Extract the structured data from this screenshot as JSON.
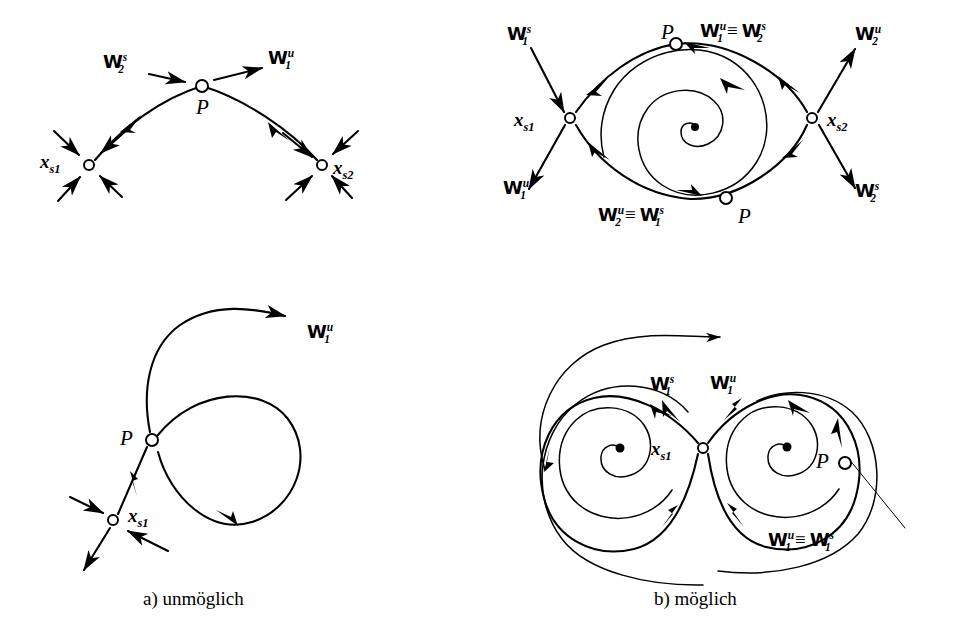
{
  "figure": {
    "kind": "mathematical-phase-portrait-diagram",
    "background_color": "#ffffff",
    "ink_color": "#000000",
    "captions": [
      {
        "id": "caption-a",
        "text": "a) unmöglich",
        "x": 143,
        "y": 597
      },
      {
        "id": "caption-b",
        "text": "b) möglich",
        "x": 654,
        "y": 597
      }
    ]
  },
  "panels": [
    {
      "id": "panel-top-left",
      "position": "top-left",
      "description": "Heteroclinic arc from saddle x_s1 over point P to saddle x_s2",
      "labels": [
        {
          "name": "label-W2s",
          "base": "W",
          "sup": "s",
          "sub": "2",
          "x": 103,
          "y": 58
        },
        {
          "name": "label-W1u",
          "base": "W",
          "sup": "u",
          "sub": "1",
          "x": 268,
          "y": 54
        },
        {
          "name": "label-P",
          "text": "P",
          "x": 196,
          "y": 99
        },
        {
          "name": "label-xs1",
          "base": "x",
          "sub": "s1",
          "x": 44,
          "y": 148
        },
        {
          "name": "label-xs2",
          "base": "x",
          "sub": "s2",
          "x": 333,
          "y": 155
        }
      ],
      "nodes": [
        {
          "name": "saddle-xs1",
          "type": "open-circle",
          "x": 89,
          "y": 165
        },
        {
          "name": "point-P",
          "type": "open-circle",
          "x": 202,
          "y": 86
        },
        {
          "name": "saddle-xs2",
          "type": "open-circle",
          "x": 322,
          "y": 165
        }
      ]
    },
    {
      "id": "panel-top-right",
      "position": "top-right",
      "description": "Lens shaped heteroclinic cycle between saddles x_s1 and x_s2 enclosing an unstable spiral focus",
      "labels": [
        {
          "name": "label-W1s",
          "base": "W",
          "sup": "s",
          "sub": "1",
          "x": 507,
          "y": 29
        },
        {
          "name": "label-P-top",
          "text": "P",
          "x": 665,
          "y": 27
        },
        {
          "name": "label-W1u-eq-W2s",
          "base": "W",
          "sup": "u",
          "sub": "1",
          "eq": "≡",
          "base2": "W",
          "sup2": "s",
          "sub2": "2",
          "x": 700,
          "y": 26
        },
        {
          "name": "label-W2u",
          "base": "W",
          "sup": "u",
          "sub": "2",
          "x": 855,
          "y": 29
        },
        {
          "name": "label-xs1",
          "base": "x",
          "sub": "s1",
          "x": 518,
          "y": 108
        },
        {
          "name": "label-xs2",
          "base": "x",
          "sub": "s2",
          "x": 827,
          "y": 108
        },
        {
          "name": "label-W1u",
          "base": "W",
          "sup": "u",
          "sub": "1",
          "x": 505,
          "y": 182
        },
        {
          "name": "label-W2s",
          "base": "W",
          "sup": "s",
          "sub": "2",
          "x": 855,
          "y": 185
        },
        {
          "name": "label-W2u-eq-W1s",
          "base": "W",
          "sup": "u",
          "sub": "2",
          "eq": "≡",
          "base2": "W",
          "sup2": "s",
          "sub2": "1",
          "x": 600,
          "y": 209
        },
        {
          "name": "label-P-bottom",
          "text": "P",
          "x": 741,
          "y": 208
        }
      ],
      "nodes": [
        {
          "name": "saddle-xs1",
          "type": "open-circle",
          "x": 570,
          "y": 118
        },
        {
          "name": "saddle-xs2",
          "type": "open-circle",
          "x": 812,
          "y": 118
        },
        {
          "name": "point-P-top",
          "type": "open-circle",
          "x": 676,
          "y": 44
        },
        {
          "name": "point-P-bottom",
          "type": "open-circle",
          "x": 726,
          "y": 198
        },
        {
          "name": "spiral-focus",
          "type": "filled-dot",
          "x": 695,
          "y": 127
        }
      ]
    },
    {
      "id": "panel-bottom-left",
      "position": "bottom-left",
      "description": "Homoclinic loop at P with an escaping unstable branch W_1^u and a separate saddle x_s1",
      "labels": [
        {
          "name": "label-W1u",
          "base": "W",
          "sup": "u",
          "sub": "1",
          "x": 307,
          "y": 327
        },
        {
          "name": "label-P",
          "text": "P",
          "x": 122,
          "y": 430
        },
        {
          "name": "label-xs1",
          "base": "x",
          "sub": "s1",
          "x": 128,
          "y": 504
        }
      ],
      "nodes": [
        {
          "name": "point-P",
          "type": "open-circle",
          "x": 152,
          "y": 440
        },
        {
          "name": "saddle-xs1",
          "type": "open-circle",
          "x": 113,
          "y": 520
        }
      ]
    },
    {
      "id": "panel-bottom-right",
      "position": "bottom-right",
      "description": "Figure-eight homoclinic connection at saddle x_s1 around two spiral foci, with point P on the outer orbit",
      "labels": [
        {
          "name": "label-W1s",
          "base": "W",
          "sup": "s",
          "sub": "1",
          "x": 654,
          "y": 379
        },
        {
          "name": "label-W1u",
          "base": "W",
          "sup": "u",
          "sub": "1",
          "x": 712,
          "y": 378
        },
        {
          "name": "label-xs1",
          "base": "x",
          "sub": "s1",
          "x": 655,
          "y": 437
        },
        {
          "name": "label-P",
          "text": "P",
          "x": 818,
          "y": 453
        },
        {
          "name": "label-W1u-eq-W1s",
          "base": "W",
          "sup": "u",
          "sub": "1",
          "eq": "≡",
          "base2": "W",
          "sup2": "s",
          "sub2": "1",
          "x": 770,
          "y": 534
        }
      ],
      "nodes": [
        {
          "name": "saddle-xs1",
          "type": "open-circle",
          "x": 703,
          "y": 448
        },
        {
          "name": "point-P",
          "type": "open-circle",
          "x": 845,
          "y": 463
        },
        {
          "name": "spiral-focus-left",
          "type": "filled-dot",
          "x": 620,
          "y": 448
        },
        {
          "name": "spiral-focus-right",
          "type": "filled-dot",
          "x": 787,
          "y": 447
        }
      ]
    }
  ]
}
